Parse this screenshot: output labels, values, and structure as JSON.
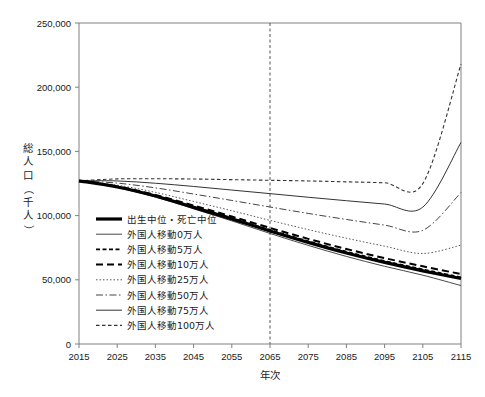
{
  "chart_data": {
    "type": "line",
    "title": "",
    "xlabel": "年次",
    "ylabel": "総人口（千人）",
    "ylabel_chars": [
      "総",
      "人",
      "口",
      "（",
      "千",
      "人",
      "）"
    ],
    "xlim": [
      2015,
      2115
    ],
    "ylim": [
      0,
      250000
    ],
    "grid": false,
    "legend_position": "inside-left-lower",
    "x_ticks": [
      2015,
      2025,
      2035,
      2045,
      2055,
      2065,
      2075,
      2085,
      2095,
      2105,
      2115
    ],
    "x_tick_labels": [
      "2015",
      "2025",
      "2035",
      "2045",
      "2055",
      "2065",
      "2075",
      "2085",
      "2095",
      "2105",
      "2115"
    ],
    "y_ticks": [
      0,
      50000,
      100000,
      150000,
      200000,
      250000
    ],
    "y_tick_labels": [
      "0",
      "50,000",
      "100,000",
      "150,000",
      "200,000",
      "250,000"
    ],
    "annotations": [
      {
        "name": "year-2065-marker",
        "type": "vertical-line",
        "x": 2065,
        "style": "dashed"
      }
    ],
    "x": [
      2015,
      2025,
      2035,
      2045,
      2055,
      2065,
      2075,
      2085,
      2095,
      2105,
      2115
    ],
    "series": [
      {
        "name": "出生中位・死亡中位",
        "label": "出生中位・死亡中位",
        "style": "solid",
        "width": 3.2,
        "color": "#000000",
        "values": [
          127095,
          122254,
          115216,
          106421,
          97441,
          88077,
          79155,
          70898,
          63533,
          57000,
          51000
        ]
      },
      {
        "name": "外国人移動0万人",
        "label": "外国人移動0万人",
        "style": "solid",
        "width": 0.9,
        "color": "#333333",
        "values": [
          127095,
          121900,
          114500,
          105300,
          95900,
          86100,
          76800,
          68200,
          60500,
          53600,
          45500
        ]
      },
      {
        "name": "外国人移動5万人",
        "label": "外国人移動5万人",
        "style": "dotted-dash",
        "width": 1.6,
        "color": "#000000",
        "values": [
          127095,
          122400,
          115500,
          106900,
          98100,
          88900,
          80100,
          72000,
          64700,
          58200,
          52000
        ]
      },
      {
        "name": "外国人移動10万人",
        "label": "外国人移動10万人",
        "style": "dashed",
        "width": 2.0,
        "color": "#000000",
        "values": [
          127095,
          122700,
          116100,
          107800,
          99300,
          90400,
          81900,
          74000,
          66900,
          60500,
          54500
        ]
      },
      {
        "name": "外国人移動25万人",
        "label": "外国人移動25万人",
        "style": "fine-dotted",
        "width": 0.9,
        "color": "#444444",
        "values": [
          127095,
          123700,
          118100,
          111000,
          103800,
          96300,
          89100,
          82400,
          76200,
          70500,
          77000
        ]
      },
      {
        "name": "外国人移動50万人",
        "label": "外国人移動50万人",
        "style": "dash-dot",
        "width": 1.0,
        "color": "#444444",
        "values": [
          127095,
          125300,
          121600,
          116800,
          111800,
          106700,
          101700,
          97000,
          92600,
          88500,
          118000
        ]
      },
      {
        "name": "外国人移動75万人",
        "label": "外国人移動75万人",
        "style": "solid",
        "width": 1.0,
        "color": "#333333",
        "values": [
          127095,
          127000,
          125200,
          122700,
          119900,
          117100,
          114300,
          111600,
          109000,
          106600,
          157000
        ]
      },
      {
        "name": "外国人移動100万人",
        "label": "外国人移動100万人",
        "style": "fine-dashed",
        "width": 1.1,
        "color": "#333333",
        "values": [
          127095,
          128600,
          128700,
          128500,
          128000,
          127500,
          127000,
          126300,
          125600,
          124900,
          218000
        ]
      }
    ]
  },
  "legend": {
    "items": [
      {
        "label": "出生中位・死亡中位"
      },
      {
        "label": "外国人移動0万人"
      },
      {
        "label": "外国人移動5万人"
      },
      {
        "label": "外国人移動10万人"
      },
      {
        "label": "外国人移動25万人"
      },
      {
        "label": "外国人移動50万人"
      },
      {
        "label": "外国人移動75万人"
      },
      {
        "label": "外国人移動100万人"
      }
    ]
  }
}
